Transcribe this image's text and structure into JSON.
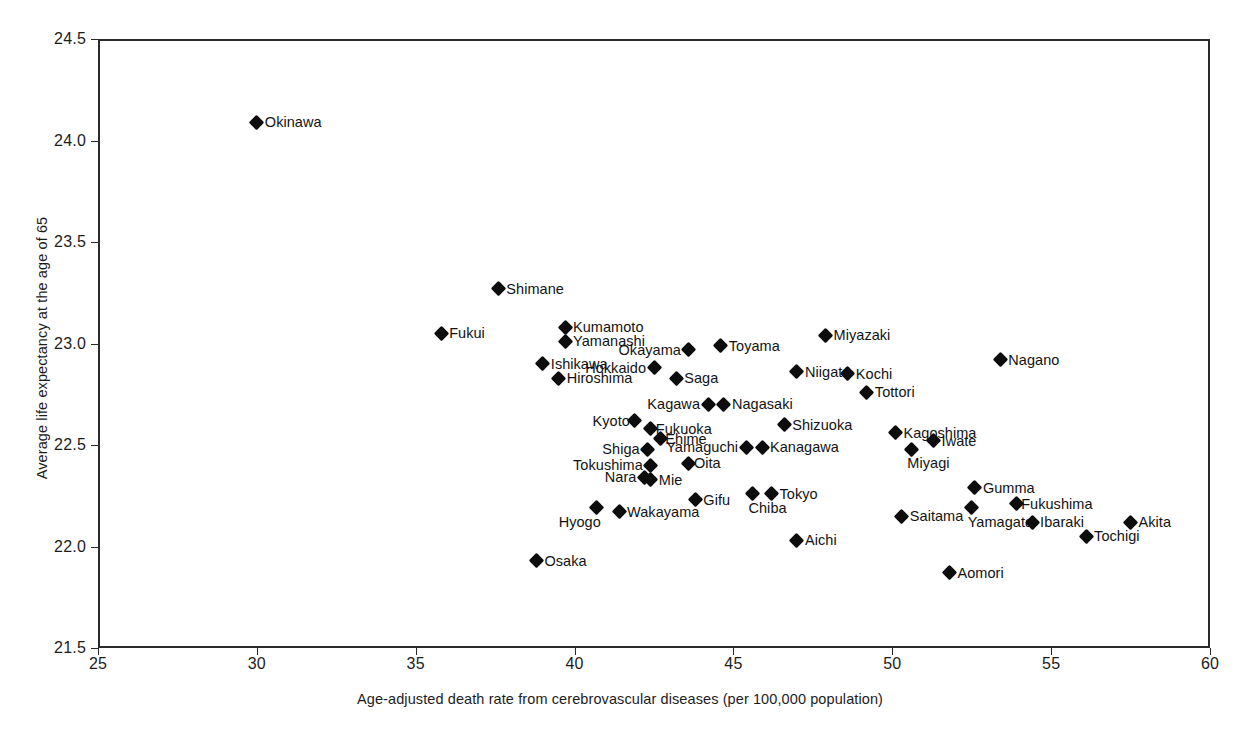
{
  "chart_data": {
    "type": "scatter",
    "title": "",
    "xlabel": "Age-adjusted death rate from cerebrovascular diseases (per 100,000 population)",
    "ylabel": "Average life expectancy at the age of 65",
    "xlim": [
      25,
      60
    ],
    "ylim": [
      21.5,
      24.5
    ],
    "xticks": [
      "25",
      "30",
      "35",
      "40",
      "45",
      "50",
      "55",
      "60"
    ],
    "yticks": [
      "21.5",
      "22.0",
      "22.5",
      "23.0",
      "23.5",
      "24.0",
      "24.5"
    ],
    "grid": false,
    "legend": "none",
    "marker": "filled-diamond",
    "marker_color": "#0d0d0d",
    "points": [
      {
        "label": "Okinawa",
        "x": 30.0,
        "y": 24.09,
        "pos": "right"
      },
      {
        "label": "Shimane",
        "x": 37.6,
        "y": 23.27,
        "pos": "right"
      },
      {
        "label": "Fukui",
        "x": 35.8,
        "y": 23.05,
        "pos": "right"
      },
      {
        "label": "Kumamoto",
        "x": 39.7,
        "y": 23.08,
        "pos": "right"
      },
      {
        "label": "Yamanashi",
        "x": 39.7,
        "y": 23.01,
        "pos": "right"
      },
      {
        "label": "Miyazaki",
        "x": 47.9,
        "y": 23.04,
        "pos": "right"
      },
      {
        "label": "Toyama",
        "x": 44.6,
        "y": 22.99,
        "pos": "right"
      },
      {
        "label": "Okayama",
        "x": 43.6,
        "y": 22.97,
        "pos": "left"
      },
      {
        "label": "Ishikawa",
        "x": 39.0,
        "y": 22.9,
        "pos": "right"
      },
      {
        "label": "Nagano",
        "x": 53.4,
        "y": 22.92,
        "pos": "right"
      },
      {
        "label": "Hokkaido",
        "x": 42.5,
        "y": 22.88,
        "pos": "left"
      },
      {
        "label": "Hiroshima",
        "x": 39.5,
        "y": 22.83,
        "pos": "right"
      },
      {
        "label": "Saga",
        "x": 43.2,
        "y": 22.83,
        "pos": "right"
      },
      {
        "label": "Niigata",
        "x": 47.0,
        "y": 22.86,
        "pos": "right"
      },
      {
        "label": "Kochi",
        "x": 48.6,
        "y": 22.85,
        "pos": "right"
      },
      {
        "label": "Tottori",
        "x": 49.2,
        "y": 22.76,
        "pos": "right"
      },
      {
        "label": "Kagawa",
        "x": 44.2,
        "y": 22.7,
        "pos": "left"
      },
      {
        "label": "Nagasaki",
        "x": 44.7,
        "y": 22.7,
        "pos": "right"
      },
      {
        "label": "Kyoto",
        "x": 41.9,
        "y": 22.62,
        "pos": "left-tight"
      },
      {
        "label": "Fukuoka",
        "x": 42.4,
        "y": 22.58,
        "pos": "right-tight"
      },
      {
        "label": "Shizuoka",
        "x": 46.6,
        "y": 22.6,
        "pos": "right"
      },
      {
        "label": "Kagoshima",
        "x": 50.1,
        "y": 22.56,
        "pos": "right"
      },
      {
        "label": "Ehime",
        "x": 42.7,
        "y": 22.53,
        "pos": "right-tight"
      },
      {
        "label": "Iwate",
        "x": 51.3,
        "y": 22.52,
        "pos": "right"
      },
      {
        "label": "Shiga",
        "x": 42.3,
        "y": 22.48,
        "pos": "left"
      },
      {
        "label": "Yamaguchi",
        "x": 45.4,
        "y": 22.49,
        "pos": "left"
      },
      {
        "label": "Kanagawa",
        "x": 45.9,
        "y": 22.49,
        "pos": "right"
      },
      {
        "label": "Miyagi",
        "x": 50.6,
        "y": 22.48,
        "pos": "below"
      },
      {
        "label": "Tokushima",
        "x": 42.4,
        "y": 22.4,
        "pos": "left"
      },
      {
        "label": "Oita",
        "x": 43.6,
        "y": 22.41,
        "pos": "right-tight"
      },
      {
        "label": "Nara",
        "x": 42.2,
        "y": 22.34,
        "pos": "left"
      },
      {
        "label": "Mie",
        "x": 42.4,
        "y": 22.33,
        "pos": "right"
      },
      {
        "label": "Gumma",
        "x": 52.6,
        "y": 22.29,
        "pos": "right"
      },
      {
        "label": "Gifu",
        "x": 43.8,
        "y": 22.23,
        "pos": "right"
      },
      {
        "label": "Tokyo",
        "x": 46.2,
        "y": 22.26,
        "pos": "right"
      },
      {
        "label": "Chiba",
        "x": 45.6,
        "y": 22.26,
        "pos": "below"
      },
      {
        "label": "Fukushima",
        "x": 53.9,
        "y": 22.21,
        "pos": "right-tight"
      },
      {
        "label": "Hyogo",
        "x": 40.7,
        "y": 22.19,
        "pos": "below-left"
      },
      {
        "label": "Wakayama",
        "x": 41.4,
        "y": 22.17,
        "pos": "right"
      },
      {
        "label": "Saitama",
        "x": 50.3,
        "y": 22.15,
        "pos": "right"
      },
      {
        "label": "Yamagata",
        "x": 52.5,
        "y": 22.19,
        "pos": "below"
      },
      {
        "label": "Ibaraki",
        "x": 54.4,
        "y": 22.12,
        "pos": "right"
      },
      {
        "label": "Akita",
        "x": 57.5,
        "y": 22.12,
        "pos": "right"
      },
      {
        "label": "Aichi",
        "x": 47.0,
        "y": 22.03,
        "pos": "right"
      },
      {
        "label": "Tochigi",
        "x": 56.1,
        "y": 22.05,
        "pos": "right"
      },
      {
        "label": "Osaka",
        "x": 38.8,
        "y": 21.93,
        "pos": "right"
      },
      {
        "label": "Aomori",
        "x": 51.8,
        "y": 21.87,
        "pos": "right"
      }
    ]
  }
}
